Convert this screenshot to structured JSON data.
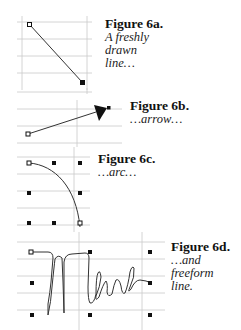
{
  "figures": [
    {
      "id": "6a",
      "title": "Figure 6a.",
      "description": "A freshly\ndrawn\nline…",
      "shape": "line"
    },
    {
      "id": "6b",
      "title": "Figure 6b.",
      "description": "…arrow…",
      "shape": "arrow"
    },
    {
      "id": "6c",
      "title": "Figure 6c.",
      "description": "…arc…",
      "shape": "arc"
    },
    {
      "id": "6d",
      "title": "Figure 6d.",
      "description": "…and\nfreeform\nline.",
      "shape": "freeform",
      "scribble_text": "Mara"
    }
  ],
  "colors": {
    "gridline": "#c9c9c9",
    "handle": "#111111",
    "stroke": "#333333",
    "background": "#ffffff"
  }
}
